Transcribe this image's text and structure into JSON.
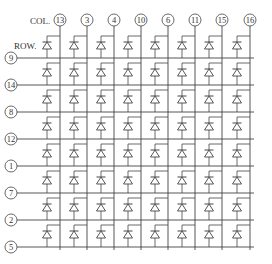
{
  "diagram": {
    "col_header": "COL.",
    "row_header": "ROW.",
    "columns": [
      "13",
      "3",
      "4",
      "10",
      "6",
      "11",
      "15",
      "16"
    ],
    "rows": [
      "9",
      "14",
      "8",
      "12",
      "1",
      "7",
      "2",
      "5"
    ],
    "element": "diode-led",
    "line_color": "#444444",
    "text_color": "#333333"
  }
}
